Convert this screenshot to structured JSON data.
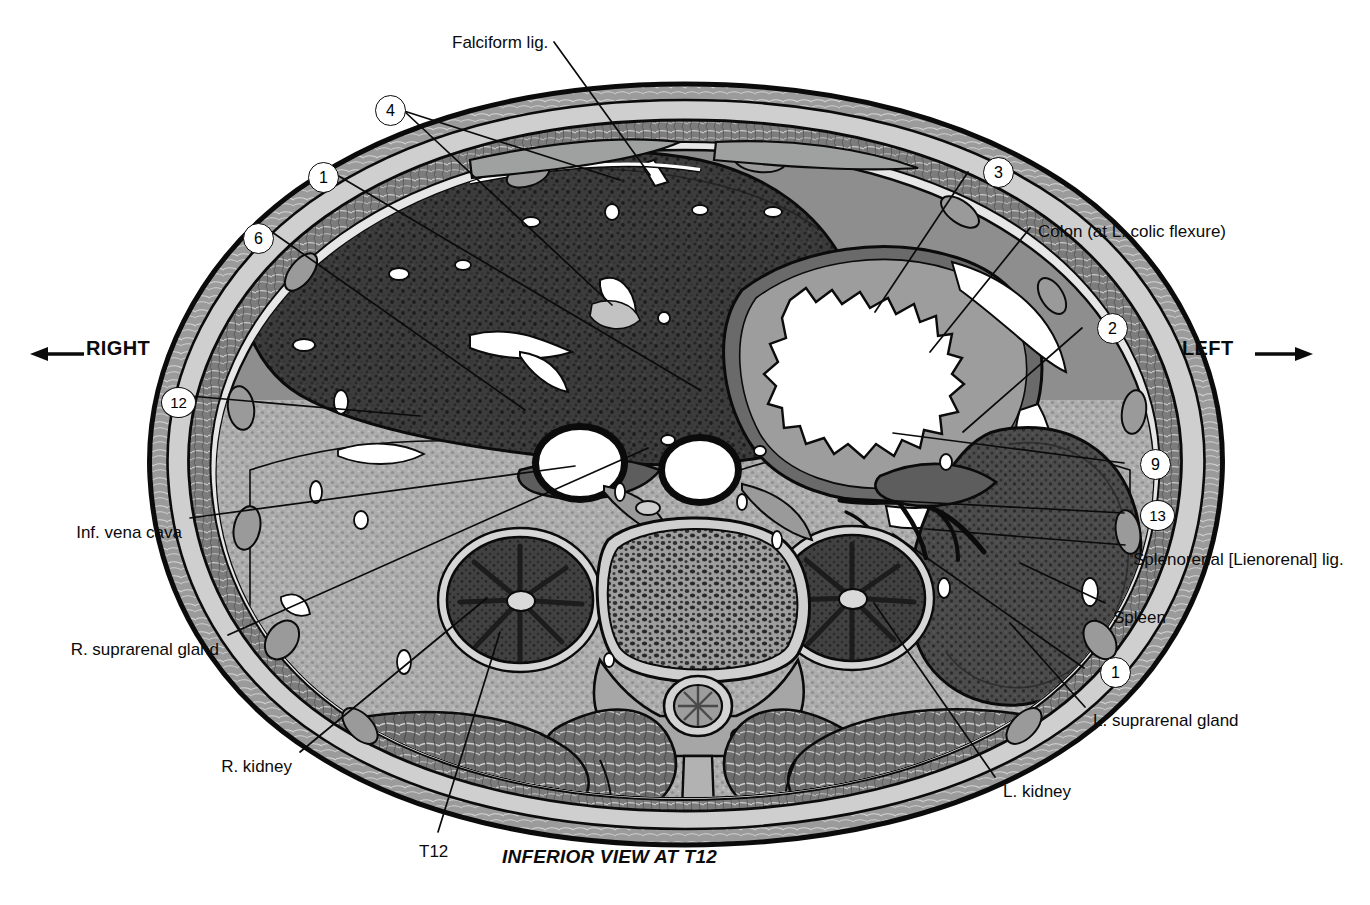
{
  "figure": {
    "caption": "INFERIOR VIEW AT T12",
    "orientation": {
      "right_label": "RIGHT",
      "left_label": "LEFT",
      "right_arrow_icon": "arrow-left-icon",
      "left_arrow_icon": "arrow-right-icon"
    }
  },
  "colors": {
    "ink": "#0b0b0b",
    "paper": "#ffffff",
    "skin_outer": "#2b2b2b",
    "fat_layer": "#b9b9b9",
    "muscle_layer": "#6e6e6e",
    "liver": "#3a3a3a",
    "spleen": "#4a4a4a",
    "kidney": "#3f3f3f",
    "vertebra_body": "#8a8a8a",
    "retroperitoneal_fat": "#a8a8a8",
    "vessel_lumen": "#ffffff",
    "colon_lumen": "#ffffff"
  },
  "text_labels": [
    {
      "id": "falciform",
      "text": "Falciform lig.",
      "x": 452,
      "y": 33,
      "align": "left"
    },
    {
      "id": "colon",
      "text": "Colon (at L. colic flexure)",
      "x": 1038,
      "y": 222,
      "align": "left"
    },
    {
      "id": "splenorenal",
      "text": "Splenorenal [Lienorenal] lig.",
      "x": 1133,
      "y": 550,
      "align": "left"
    },
    {
      "id": "spleen",
      "text": "Spleen",
      "x": 1113,
      "y": 608,
      "align": "left"
    },
    {
      "id": "l-suprarenal",
      "text": "L. suprarenal gland",
      "x": 1093,
      "y": 711,
      "align": "left"
    },
    {
      "id": "l-kidney",
      "text": "L. kidney",
      "x": 1003,
      "y": 782,
      "align": "left"
    },
    {
      "id": "ivc",
      "text": "Inf. vena cava",
      "x": 182,
      "y": 523,
      "align": "right"
    },
    {
      "id": "r-suprarenal",
      "text": "R. suprarenal gland",
      "x": 219,
      "y": 640,
      "align": "right"
    },
    {
      "id": "r-kidney",
      "text": "R. kidney",
      "x": 292,
      "y": 757,
      "align": "right"
    },
    {
      "id": "t12",
      "text": "T12",
      "x": 419,
      "y": 842,
      "align": "left"
    }
  ],
  "numbered_keys": [
    {
      "n": "4",
      "x": 375,
      "y": 95
    },
    {
      "n": "1",
      "x": 308,
      "y": 162
    },
    {
      "n": "6",
      "x": 243,
      "y": 223
    },
    {
      "n": "12",
      "x": 161,
      "y": 387
    },
    {
      "n": "3",
      "x": 983,
      "y": 157
    },
    {
      "n": "2",
      "x": 1097,
      "y": 313
    },
    {
      "n": "9",
      "x": 1140,
      "y": 449
    },
    {
      "n": "13",
      "x": 1140,
      "y": 500
    },
    {
      "n": "1",
      "x": 1100,
      "y": 657
    }
  ],
  "leader_lines": [
    {
      "from": "falciform",
      "x1": 554,
      "y1": 42,
      "x2": 650,
      "y2": 175
    },
    {
      "from": "4a",
      "x1": 404,
      "y1": 111,
      "x2": 620,
      "y2": 180
    },
    {
      "from": "4b",
      "x1": 404,
      "y1": 111,
      "x2": 612,
      "y2": 305
    },
    {
      "from": "1-left",
      "x1": 337,
      "y1": 175,
      "x2": 700,
      "y2": 390
    },
    {
      "from": "6",
      "x1": 272,
      "y1": 232,
      "x2": 525,
      "y2": 410
    },
    {
      "from": "12",
      "x1": 190,
      "y1": 396,
      "x2": 420,
      "y2": 416
    },
    {
      "from": "3",
      "x1": 968,
      "y1": 172,
      "x2": 875,
      "y2": 312
    },
    {
      "from": "colon",
      "x1": 1030,
      "y1": 228,
      "x2": 930,
      "y2": 352
    },
    {
      "from": "2",
      "x1": 1082,
      "y1": 328,
      "x2": 963,
      "y2": 432
    },
    {
      "from": "9",
      "x1": 1124,
      "y1": 463,
      "x2": 893,
      "y2": 433
    },
    {
      "from": "13",
      "x1": 1124,
      "y1": 513,
      "x2": 843,
      "y2": 498
    },
    {
      "from": "splenorenal",
      "x1": 1125,
      "y1": 545,
      "x2": 926,
      "y2": 529
    },
    {
      "from": "spleen",
      "x1": 1105,
      "y1": 603,
      "x2": 1020,
      "y2": 563
    },
    {
      "from": "1-right",
      "x1": 1084,
      "y1": 668,
      "x2": 893,
      "y2": 534
    },
    {
      "from": "l-supra",
      "x1": 1085,
      "y1": 707,
      "x2": 1010,
      "y2": 623
    },
    {
      "from": "l-kidney",
      "x1": 995,
      "y1": 777,
      "x2": 874,
      "y2": 603
    },
    {
      "from": "ivc",
      "x1": 190,
      "y1": 518,
      "x2": 575,
      "y2": 466
    },
    {
      "from": "r-supra",
      "x1": 228,
      "y1": 635,
      "x2": 648,
      "y2": 448
    },
    {
      "from": "r-kidney",
      "x1": 300,
      "y1": 752,
      "x2": 487,
      "y2": 598
    },
    {
      "from": "t12",
      "x1": 438,
      "y1": 832,
      "x2": 500,
      "y2": 632
    }
  ],
  "anatomy_regions": [
    {
      "name": "liver",
      "side": "right"
    },
    {
      "name": "spleen",
      "side": "left"
    },
    {
      "name": "stomach",
      "side": "left"
    },
    {
      "name": "colon-left-colic-flexure",
      "side": "left"
    },
    {
      "name": "right-kidney",
      "side": "right"
    },
    {
      "name": "left-kidney",
      "side": "left"
    },
    {
      "name": "inferior-vena-cava",
      "side": "right"
    },
    {
      "name": "abdominal-aorta",
      "side": "left"
    },
    {
      "name": "t12-vertebral-body",
      "side": "midline"
    },
    {
      "name": "spinal-cord",
      "side": "midline"
    },
    {
      "name": "erector-spinae-muscles",
      "side": "posterior"
    },
    {
      "name": "abdominal-wall-muscles",
      "side": "anterior"
    }
  ]
}
